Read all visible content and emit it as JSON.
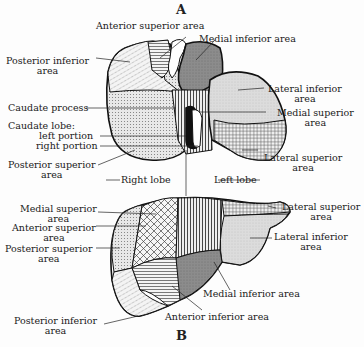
{
  "figures": {
    "a": {
      "letter": "A"
    },
    "b": {
      "letter": "B"
    }
  },
  "view_a": {
    "labels": {
      "anterior_superior": "Anterior superior area",
      "medial_inferior": "Medial inferior area",
      "posterior_inferior_1": "Posterior inferior",
      "posterior_inferior_2": "area",
      "lateral_inferior_1": "Lateral inferior",
      "lateral_inferior_2": "area",
      "caudate_process": "Caudate process",
      "medial_superior_1": "Medial superior",
      "medial_superior_2": "area",
      "caudate_lobe": "Caudate lobe:",
      "left_portion": "left portion",
      "right_portion": "right portion",
      "lateral_superior_1": "Lateral superior",
      "lateral_superior_2": "area",
      "posterior_superior_1": "Posterior superior",
      "posterior_superior_2": "area",
      "right_lobe": "Right lobe",
      "left_lobe": "Left lobe"
    }
  },
  "view_b": {
    "labels": {
      "medial_superior_1": "Medial superior",
      "medial_superior_2": "area",
      "lateral_superior_1": "Lateral superior",
      "lateral_superior_2": "area",
      "anterior_superior_1": "Anterior superior",
      "anterior_superior_2": "area",
      "lateral_inferior_1": "Lateral inferior",
      "lateral_inferior_2": "area",
      "posterior_superior_1": "Posterior superior",
      "posterior_superior_2": "area",
      "medial_inferior": "Medial inferior area",
      "posterior_inferior_1": "Posterior inferior",
      "posterior_inferior_2": "area",
      "anterior_inferior": "Anterior inferior area"
    }
  },
  "colors": {
    "outline": "#111111",
    "dark_fill": "#8a8a8a",
    "light_fill": "#d8d8d8",
    "black_fill": "#111111"
  }
}
